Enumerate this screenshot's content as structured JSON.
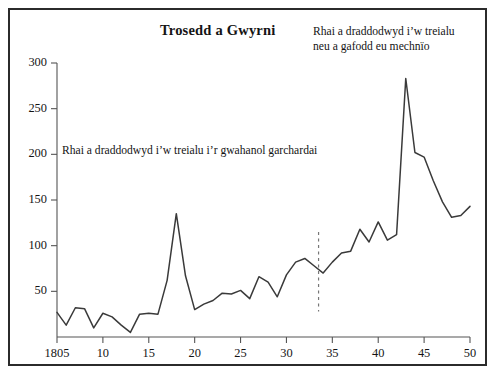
{
  "figure": {
    "title": "Trosedd a Gwyrni",
    "border_color": "#2b2b2b",
    "background": "#ffffff",
    "line_color": "#3a3a3a",
    "axis_color": "#555555"
  },
  "annotations": [
    {
      "name": "annot-upper-right",
      "line1": "Rhai a draddodwyd i’w treialu",
      "line2": "neu a gafodd eu mechnïo"
    },
    {
      "name": "annot-mid-left",
      "line1": "Rhai a draddodwyd i’w treialu i’r gwahanol garchardai"
    }
  ],
  "axes": {
    "y_ticks": [
      300,
      250,
      200,
      150,
      100,
      50
    ],
    "y_tick_labels": [
      "300",
      "250",
      "200",
      "150",
      "100",
      "50"
    ],
    "x_ticks": [
      1805,
      1810,
      1815,
      1820,
      1825,
      1830,
      1835,
      1840,
      1845,
      1850
    ],
    "x_tick_labels": [
      "1805",
      "10",
      "15",
      "20",
      "25",
      "30",
      "35",
      "40",
      "45",
      "50"
    ]
  },
  "marker_line": {
    "name": "vertical-dashed-divider",
    "x_value": 1833.5,
    "y_top": 115,
    "y_bottom": 28,
    "style": "dashed"
  },
  "chart_data": {
    "type": "line",
    "title": "Trosedd a Gwyrni",
    "xlabel": "",
    "ylabel": "",
    "xlim": [
      1805,
      1850
    ],
    "ylim": [
      0,
      300
    ],
    "grid": false,
    "legend": "none",
    "annotations": [
      "Rhai a draddodwyd i’w treialu neu a gafodd eu mechnïo",
      "Rhai a draddodwyd i’w treialu i’r gwahanol garchardai"
    ],
    "series": [
      {
        "name": "Trosedd a Gwyrni",
        "x": [
          1805,
          1806,
          1807,
          1808,
          1809,
          1810,
          1811,
          1812,
          1813,
          1814,
          1815,
          1816,
          1817,
          1818,
          1819,
          1820,
          1821,
          1822,
          1823,
          1824,
          1825,
          1826,
          1827,
          1828,
          1829,
          1830,
          1831,
          1832,
          1833,
          1834,
          1835,
          1836,
          1837,
          1838,
          1839,
          1840,
          1841,
          1842,
          1843,
          1844,
          1845,
          1846,
          1847,
          1848,
          1849,
          1850
        ],
        "values": [
          27,
          13,
          32,
          31,
          10,
          26,
          22,
          13,
          5,
          25,
          26,
          25,
          62,
          135,
          67,
          30,
          36,
          40,
          48,
          47,
          51,
          42,
          66,
          60,
          44,
          68,
          82,
          86,
          78,
          70,
          82,
          92,
          94,
          118,
          104,
          126,
          106,
          112,
          283,
          202,
          197,
          171,
          148,
          131,
          133,
          143
        ]
      }
    ]
  }
}
